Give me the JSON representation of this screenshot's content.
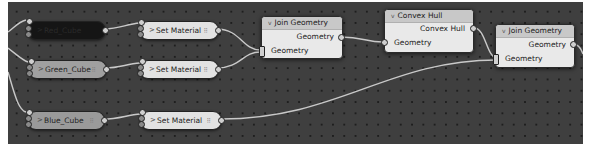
{
  "editor": {
    "type": "Geometry Node Editor",
    "background": "#3f3f3f",
    "grid_dot_color": "#1e1e1e",
    "wire_color": "#c9c9c9"
  },
  "nodes": {
    "red_cube": {
      "label": "Red_Cube",
      "collapsed": true,
      "chevron": ">"
    },
    "green_cube": {
      "label": "Green_Cube",
      "collapsed": true,
      "chevron": ">"
    },
    "blue_cube": {
      "label": "Blue_Cube",
      "collapsed": true,
      "chevron": ">"
    },
    "set_material_1": {
      "label": "Set Material",
      "collapsed": true,
      "chevron": ">"
    },
    "set_material_2": {
      "label": "Set Material",
      "collapsed": true,
      "chevron": ">"
    },
    "set_material_3": {
      "label": "Set Material",
      "collapsed": true,
      "chevron": ">"
    },
    "join_geometry_1": {
      "title": "Join Geometry",
      "chevron": "v",
      "outputs": [
        "Geometry"
      ],
      "inputs": [
        "Geometry"
      ]
    },
    "convex_hull": {
      "title": "Convex Hull",
      "chevron": "v",
      "outputs": [
        "Convex Hull"
      ],
      "inputs": [
        "Geometry"
      ]
    },
    "join_geometry_2": {
      "title": "Join Geometry",
      "chevron": "v",
      "outputs": [
        "Geometry"
      ],
      "inputs": [
        "Geometry"
      ]
    }
  },
  "pill_grip_glyph": "⠿",
  "links": [
    "Red_Cube -> Set Material (1)",
    "Green_Cube -> Set Material (2)",
    "Blue_Cube -> Set Material (3)",
    "Set Material (1) -> Join Geometry (1).Geometry",
    "Set Material (2) -> Join Geometry (1).Geometry",
    "Join Geometry (1).Geometry -> Convex Hull.Geometry",
    "Convex Hull.Convex Hull -> Join Geometry (2).Geometry",
    "Set Material (3) -> Join Geometry (2).Geometry",
    "Join Geometry (2).Geometry -> (off-screen)"
  ]
}
